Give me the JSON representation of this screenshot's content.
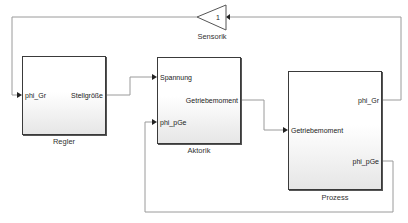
{
  "diagram": {
    "blocks": {
      "sensorik": {
        "name": "Sensorik",
        "gain": "1"
      },
      "regler": {
        "name": "Regler",
        "inputs": [
          "phi_Gr"
        ],
        "outputs": [
          "Stellgröße"
        ]
      },
      "aktorik": {
        "name": "Aktorik",
        "inputs": [
          "Spannung",
          "phi_pGe"
        ],
        "outputs": [
          "Getriebemoment"
        ]
      },
      "prozess": {
        "name": "Prozess",
        "inputs": [
          "Getriebemoment"
        ],
        "outputs": [
          "phi_Gr",
          "phi_pGe"
        ]
      }
    },
    "colors": {
      "line": "#9a9a9a",
      "block_border": "#3a3a3a",
      "arrow": "#222222"
    }
  }
}
